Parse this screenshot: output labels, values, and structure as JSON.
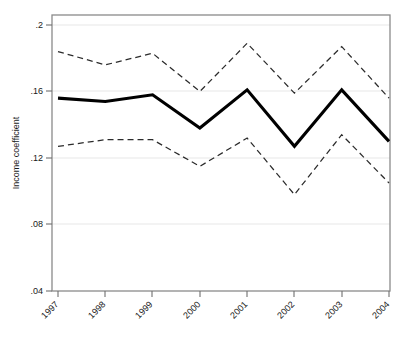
{
  "chart_data": {
    "type": "line",
    "title": "",
    "subtitle": "",
    "xlabel": "",
    "ylabel": "Income coefficient",
    "categories": [
      "1997",
      "1998",
      "1999",
      "2000",
      "2001",
      "2002",
      "2003",
      "2004"
    ],
    "x": [
      1997,
      1998,
      1999,
      2000,
      2001,
      2002,
      2003,
      2004
    ],
    "xlim": [
      1996.6,
      2004.4
    ],
    "ylim": [
      0.04,
      0.205
    ],
    "y_ticks": [
      0.04,
      0.08,
      0.12,
      0.16,
      0.2
    ],
    "y_tick_labels": [
      ".04",
      ".08",
      ".12",
      ".16",
      ".2"
    ],
    "grid": "horizontal",
    "legend": "none",
    "series": [
      {
        "name": "Income coefficient",
        "style": "solid",
        "width": 3.1,
        "color": "#000000",
        "values": [
          0.156,
          0.154,
          0.158,
          0.138,
          0.161,
          0.127,
          0.161,
          0.13
        ]
      },
      {
        "name": "Upper confidence bound",
        "style": "dashed",
        "width": 1.25,
        "color": "#2b2b2b",
        "values": [
          0.184,
          0.176,
          0.183,
          0.16,
          0.189,
          0.159,
          0.187,
          0.156
        ]
      },
      {
        "name": "Lower confidence bound",
        "style": "dashed",
        "width": 1.25,
        "color": "#2b2b2b",
        "values": [
          0.127,
          0.131,
          0.131,
          0.115,
          0.132,
          0.098,
          0.134,
          0.105
        ]
      }
    ],
    "annotations": []
  },
  "axes": {
    "y_title": "Income coefficient",
    "y_tick_labels": [
      ".2",
      ".16",
      ".12",
      ".08",
      ".04"
    ],
    "x_tick_labels": [
      "1997",
      "1998",
      "1999",
      "2000",
      "2001",
      "2002",
      "2003",
      "2004"
    ]
  },
  "colors": {
    "background": "#ffffff",
    "frame": "#8a8a8a",
    "grid": "#e8e8e8",
    "series_main": "#000000",
    "series_ci": "#2b2b2b",
    "text": "#1a1a1a"
  }
}
